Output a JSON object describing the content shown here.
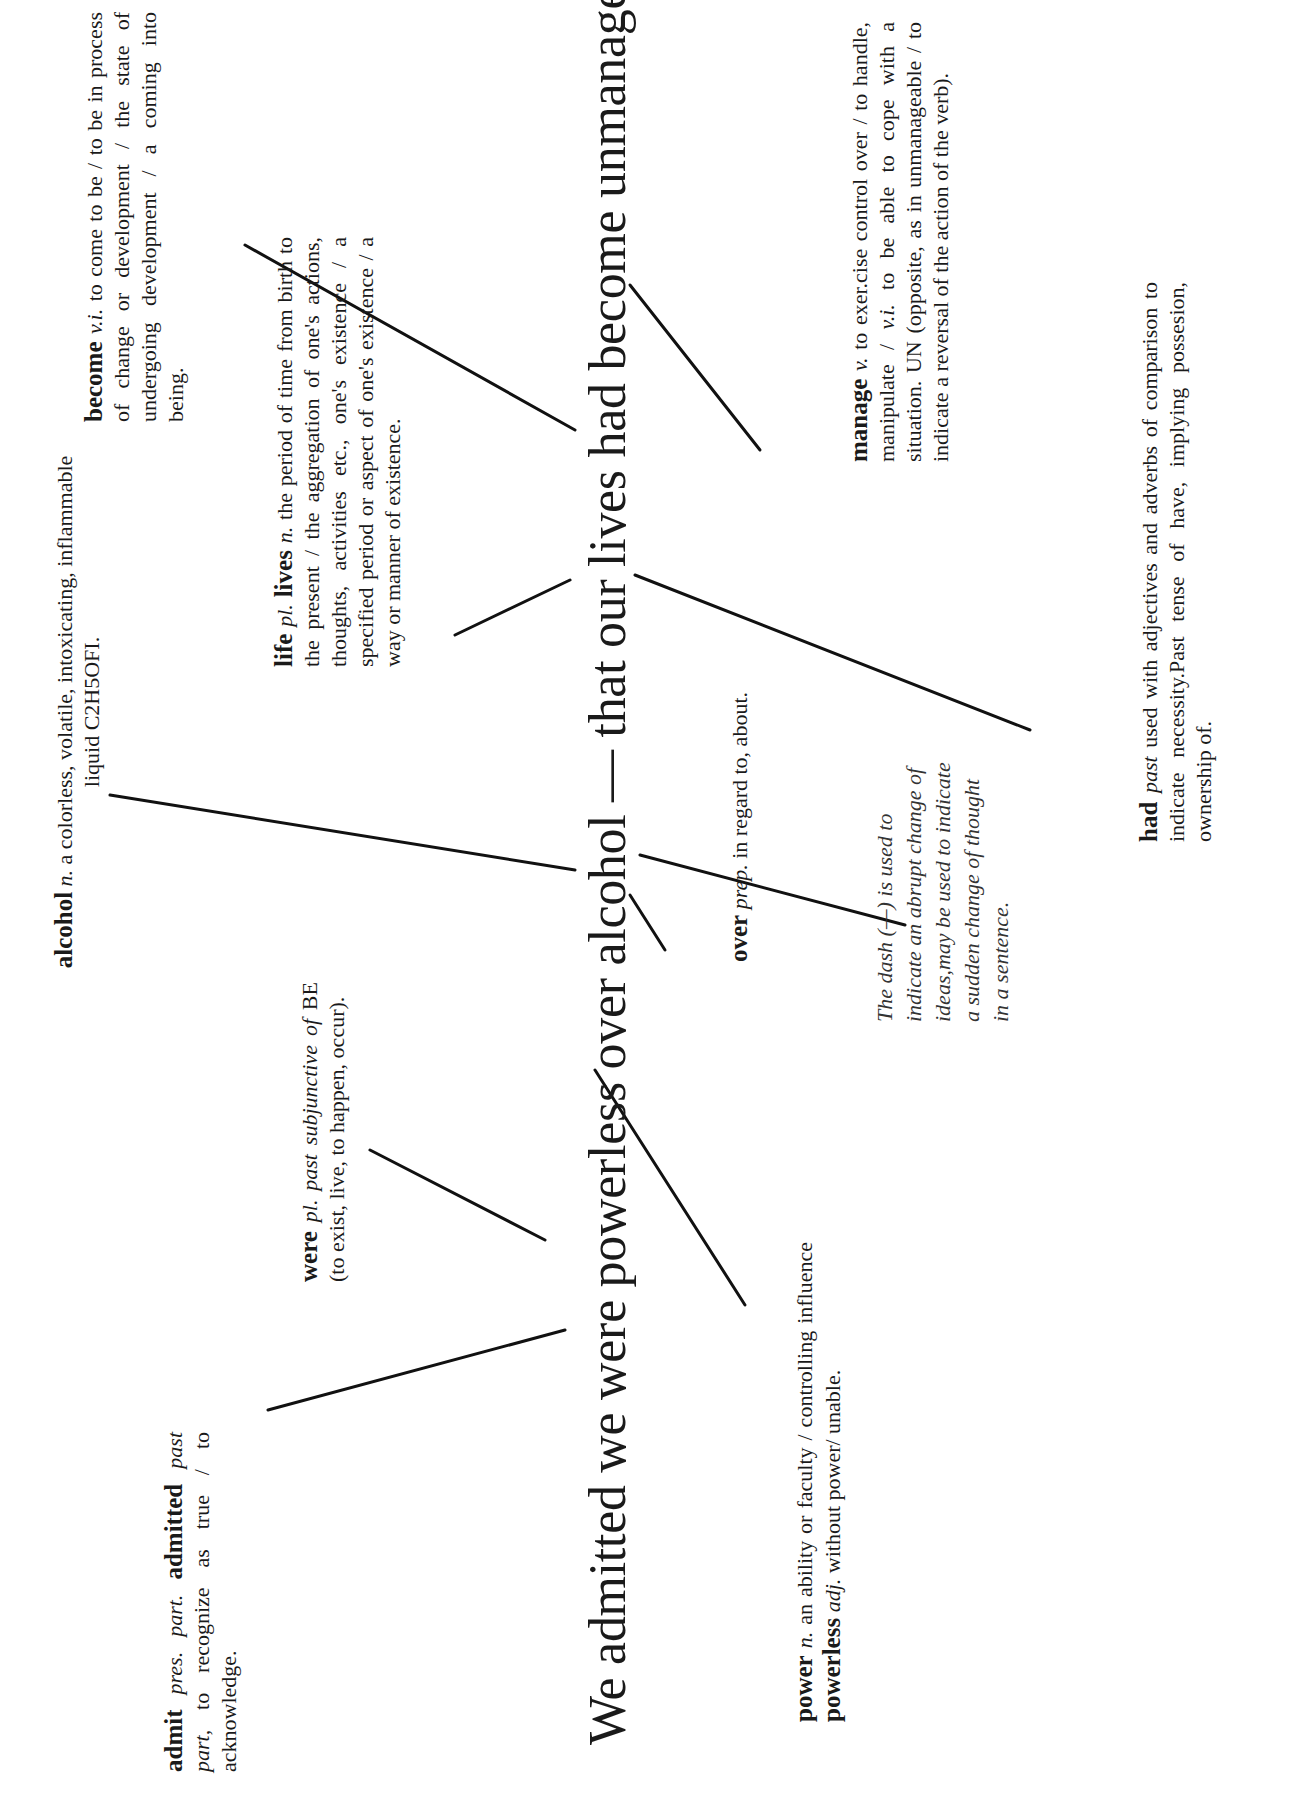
{
  "sentence": {
    "text": "We admitted we were powerless over alcohol — that our lives had become unmanageable."
  },
  "definitions": {
    "admit": {
      "headword": "admit",
      "pos1": "pres. part.",
      "headword2": "admitted",
      "pos2": "past part,",
      "text": "to recognize as true / to acknowledge."
    },
    "were": {
      "headword": "were",
      "pos": "pl. past subjunctive of",
      "text": "BE (to exist, live, to happen, occur)."
    },
    "power": {
      "headword": "power",
      "pos": "n.",
      "text1": "an ability or faculty / controlling influence",
      "headword2": "powerless",
      "pos2": "adj.",
      "text2": "without power/ unable."
    },
    "over": {
      "headword": "over",
      "pos": "prep.",
      "text": "in regard to, about."
    },
    "alcohol": {
      "headword": "alcohol",
      "pos": "n.",
      "text": "a colorless, volatile, intoxicating, inflammable liquid C2H5OFI."
    },
    "dash": {
      "text": "The dash (—) is used to indicate an abrupt change of ideas,may be used to indicate a sudden change of thought in a sentence."
    },
    "life": {
      "headword": "life",
      "pos": "pl.",
      "headword2": "lives",
      "pos2": "n.",
      "text": "the period of time from birth to the present / the aggregation of one's actions, thoughts, activities etc., one's existence / a specified period or aspect of one's existence / a way or manner of existence."
    },
    "become": {
      "headword": "become",
      "pos": "v.i.",
      "text": "to come to be / to be in process of change or development / the state of undergoing development / a coming into being."
    },
    "manage": {
      "headword": "manage",
      "pos": "v.",
      "text1": "to exer.cise control over / to handle, manipulate /",
      "pos2": "v.i.",
      "text2": "to be able to cope with a situation. UN (opposite, as in unmanageable / to indicate a reversal of the action of the verb)."
    },
    "had": {
      "headword": "had",
      "pos": "past",
      "text": "used with adjectives and adverbs of comparison to indicate necessity.Past tense of have, implying possesion, ownership of."
    }
  },
  "colors": {
    "ink": "#1a1a1a",
    "background": "#ffffff"
  }
}
